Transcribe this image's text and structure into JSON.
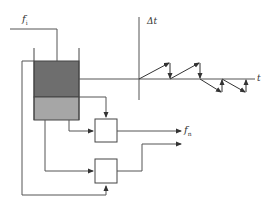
{
  "diagram": {
    "type": "control-loop-tank",
    "labels": {
      "inflow": "f",
      "inflow_sub": "i",
      "outflow": "f",
      "outflow_sub": "n",
      "y_axis": "Δt",
      "x_axis": "t"
    },
    "colors": {
      "line": "#555555",
      "tank_upper_fill": "#6e6e6e",
      "tank_lower_fill": "#a6a6a6",
      "axis": "#555555"
    },
    "blocks": [
      {
        "id": "block-1"
      },
      {
        "id": "block-2"
      }
    ]
  }
}
